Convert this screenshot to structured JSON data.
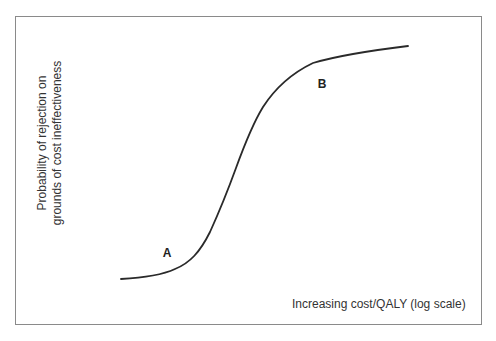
{
  "figure": {
    "y_axis_label_line1": "Probability of rejection on",
    "y_axis_label_line2": "grounds of cost ineffectiveness",
    "x_axis_label": "Increasing cost/QALY (log scale)",
    "points": [
      {
        "label": "A",
        "x": 167,
        "y": 253
      },
      {
        "label": "B",
        "x": 322,
        "y": 84
      }
    ],
    "curve_color": "#2a2a2a",
    "frame_color": "#8a8a8a"
  }
}
